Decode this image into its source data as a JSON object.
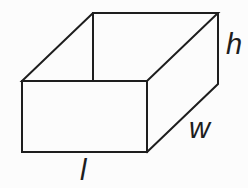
{
  "figure": {
    "labels": {
      "height": "h",
      "width": "w",
      "length": "l"
    },
    "colors": {
      "line": "#1e1e1e",
      "background": "#fcfcfc"
    }
  }
}
